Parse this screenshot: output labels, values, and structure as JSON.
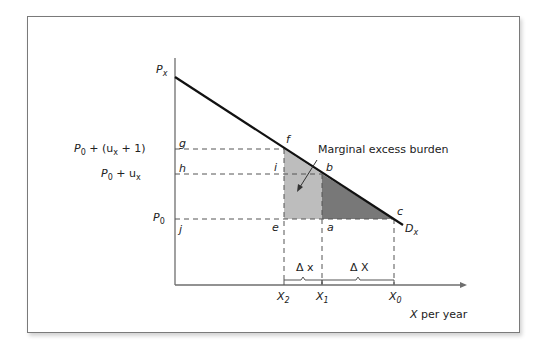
{
  "diagram": {
    "axes": {
      "y_label": "P",
      "y_label_sub": "x",
      "x_label_var": "X",
      "x_label_rest": " per year"
    },
    "price_labels": [
      {
        "id": "p_tax_plus",
        "main": "P",
        "sub0": "0",
        "rest1": " + (u",
        "sub1": "x",
        "rest2": " + 1)"
      },
      {
        "id": "p_tax",
        "main": "P",
        "sub0": "0",
        "rest1": " + u",
        "sub1": "x"
      },
      {
        "id": "p0",
        "main": "P",
        "sub0": "0"
      }
    ],
    "point_labels": {
      "g": "g",
      "h": "h",
      "j": "j",
      "f": "f",
      "i": "i",
      "b": "b",
      "e": "e",
      "a": "a",
      "c": "c"
    },
    "demand_label": {
      "main": "D",
      "sub": "x"
    },
    "quantity_labels": [
      {
        "main": "X",
        "sub": "2"
      },
      {
        "main": "X",
        "sub": "1"
      },
      {
        "main": "X",
        "sub": "0"
      }
    ],
    "delta_labels": {
      "small": "Δ x",
      "large": "Δ X"
    },
    "annotation": "Marginal excess burden",
    "colors": {
      "light_fill": "#bdbdbd",
      "dark_fill": "#787878",
      "line": "#111111",
      "axis": "#6e6e6e",
      "dash": "#555555"
    }
  }
}
